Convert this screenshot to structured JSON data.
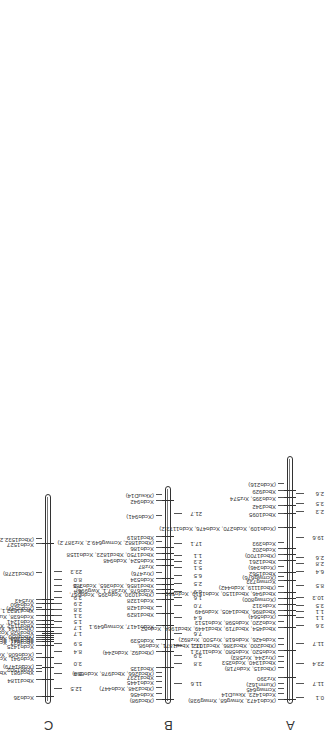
{
  "header": {
    "authors": "M.E. Sorrells, G. Pedak, S.J. Molnar, H.W. Rines, and R.L. Phillips"
  },
  "chromosomes": [
    {
      "id": "C",
      "label": "C",
      "bar": {
        "x": 40,
        "y": 48,
        "len": 210
      },
      "markers": [
        {
          "pos": 7,
          "text": "Xcdo36"
        },
        {
          "pos": 24,
          "text": "Xbcd1184"
        },
        {
          "pos": 32,
          "text": "Xbcd981, Xbcd1874"
        },
        {
          "pos": 35,
          "text": "Xcdo1502"
        },
        {
          "pos": 38,
          "text": "(Xcdo1479)"
        },
        {
          "pos": 46,
          "text": "Xcdo941, Xcdo1509, Xrz69"
        },
        {
          "pos": 50,
          "text": "(Xcdo608, Xcdo665, Xcdo1523, Xrz444)"
        },
        {
          "pos": 58,
          "text": "Xcdo1425"
        },
        {
          "pos": 62,
          "text": "Xbcd927, Xcdo54"
        },
        {
          "pos": 64,
          "text": "Xbcd941, Xcdo1174"
        },
        {
          "pos": 66,
          "text": "Xbcd263, Xcdo586, Xbcd721, Xbcd1194, Xbcd1495, Xcdo328, Xcdo585,"
        },
        {
          "pos": 68,
          "text": "(Xbcd850, Xbcd1688, Xcdo1160, Xcdo1253, Xrz244"
        },
        {
          "pos": 72,
          "text": "Xbcd828  Xcdo920, Xrz776)"
        },
        {
          "pos": 76,
          "text": "(Xbcd134, Xcdo1421, XNar)"
        },
        {
          "pos": 79,
          "text": "Xbcd1142, Xbcd1816, Xcdo353"
        },
        {
          "pos": 83,
          "text": "Xcdo1241"
        },
        {
          "pos": 88,
          "text": "Xcdo638, Xumn133"
        },
        {
          "pos": 94,
          "text": "Xbcd1532.1, Xcdo1435"
        },
        {
          "pos": 96,
          "text": "(Xcdo549)"
        },
        {
          "pos": 100,
          "text": "Xcdo460"
        },
        {
          "pos": 104,
          "text": "Xrz543"
        },
        {
          "pos": 131,
          "text": "(Xbcd1278)"
        },
        {
          "pos": 160,
          "text": "Xcdo1527"
        },
        {
          "pos": 165,
          "text": "(Xbcd1532.2)"
        }
      ],
      "distances": [
        "12.5",
        "5.4",
        "3.0",
        "8.4",
        "5.9",
        "1.7",
        "1.7",
        "1.5",
        "3.1",
        "3.8",
        "2.9",
        "3.9",
        "6.4",
        "7.3",
        "8.0",
        "23.3"
      ]
    },
    {
      "id": "B",
      "label": "B",
      "bar": {
        "x": 40,
        "y": 168,
        "len": 218
      },
      "markers": [
        {
          "pos": 4,
          "text": "(Xbcd98)"
        },
        {
          "pos": 10,
          "text": "Xcdo456"
        },
        {
          "pos": 16,
          "text": "(Xbcd348, Xcdo447)"
        },
        {
          "pos": 22,
          "text": "Xcdo1445"
        },
        {
          "pos": 27,
          "text": "Xbcd1237"
        },
        {
          "pos": 31,
          "text": "(Xbcd266, Xbcd978, Xcdo680)"
        },
        {
          "pos": 36,
          "text": "Xbcd135"
        },
        {
          "pos": 52,
          "text": "(Xbcd92, Xcdo244)"
        },
        {
          "pos": 64,
          "text": "Xcdo539"
        },
        {
          "pos": 78,
          "text": "Xcdo1417, Xcmwg649.1"
        },
        {
          "pos": 90,
          "text": "Xbcd1829"
        },
        {
          "pos": 97,
          "text": "Xbcd1428"
        },
        {
          "pos": 104,
          "text": "Xcdo1328"
        },
        {
          "pos": 110,
          "text": "(Xbcd1030, Xcdo395, Xcdo667,"
        },
        {
          "pos": 114,
          "text": "Xcdo678, Xrz387.1, Xwg996)"
        },
        {
          "pos": 119,
          "text": "Xbcd1856, Xcdo365, Xcdo385"
        },
        {
          "pos": 125,
          "text": "Xcdo534"
        },
        {
          "pos": 131,
          "text": "(Xrz476)"
        },
        {
          "pos": 138,
          "text": "Xrz87"
        },
        {
          "pos": 144,
          "text": "Xcdo524, Xcdo948"
        },
        {
          "pos": 150,
          "text": "Xbcd1750, Xbcd1823, Xcdo1158"
        },
        {
          "pos": 156,
          "text": "Xcdo186"
        },
        {
          "pos": 162,
          "text": "(Xbcd1882, Xcmwg649.2, Xrz387.2)"
        },
        {
          "pos": 167,
          "text": "Xbcd1819"
        },
        {
          "pos": 188,
          "text": "(Xcdo941)"
        },
        {
          "pos": 203,
          "text": "Xcdo942"
        },
        {
          "pos": 209,
          "text": "(XksuD14)"
        }
      ],
      "distances": [
        "11.6",
        "3.8",
        "3.9",
        "11.1",
        "7.6",
        "6.4",
        "7.0",
        "1.6",
        "6.9",
        "2.5",
        "6.5",
        "5.1",
        "2.3",
        "1.1",
        "17.1",
        "21.7"
      ]
    },
    {
      "id": "A",
      "label": "A",
      "bar": {
        "x": 40,
        "y": 290,
        "len": 248
      },
      "markers": [
        {
          "pos": 4,
          "text": "(Xcdo1473, Xmwg68, Xmwg938)"
        },
        {
          "pos": 10,
          "text": "Xcdo1423, XksuD14"
        },
        {
          "pos": 15,
          "text": "Xcmwg645"
        },
        {
          "pos": 20,
          "text": "(Xumn162)"
        },
        {
          "pos": 26,
          "text": "Xrz390"
        },
        {
          "pos": 36,
          "text": "(Xbcd15, Xcdo718)"
        },
        {
          "pos": 42,
          "text": "Xbcd1340, Xcdo353"
        },
        {
          "pos": 47,
          "text": "(Xrz244, Xrz583)"
        },
        {
          "pos": 53,
          "text": "Xcdo520, Xcdo580, Xcdo1173.1"
        },
        {
          "pos": 59,
          "text": "(Xbcd200, Xbcd386, Xbcd1072, Xbcd1871, Xcdo98,"
        },
        {
          "pos": 65,
          "text": "Xcdo426, Xcdo618, Xrz500, Xrz892)"
        },
        {
          "pos": 76,
          "text": "Xbcd454, Xbcd719, Xbcd1449, Xbcd1964, Xcdo82,"
        },
        {
          "pos": 82,
          "text": "Xcdo220, Xcdo598, Xcdo1513"
        },
        {
          "pos": 88,
          "text": "(Xcdo564)"
        },
        {
          "pos": 93,
          "text": "Xbcd896, Xbcd1405, Xcdo949"
        },
        {
          "pos": 99,
          "text": "Xcdo312"
        },
        {
          "pos": 105,
          "text": "(Xcmwg800)"
        },
        {
          "pos": 111,
          "text": "Xbcd946, Xbcd1150, Xcdo1519, Xcdo590"
        },
        {
          "pos": 117,
          "text": "(Xbcd1119, Xcdo442)"
        },
        {
          "pos": 123,
          "text": "Xcmwg733"
        },
        {
          "pos": 127,
          "text": "(Xcmwg676)"
        },
        {
          "pos": 131,
          "text": "Xbcd1562"
        },
        {
          "pos": 137,
          "text": "(Xcdo346)"
        },
        {
          "pos": 143,
          "text": "Xbcd1261"
        },
        {
          "pos": 149,
          "text": "(Xbcd1700)"
        },
        {
          "pos": 155,
          "text": "Xcdo202"
        },
        {
          "pos": 161,
          "text": "Xcdo393"
        },
        {
          "pos": 176,
          "text": "(Xcdo109, Xcdo270, Xcdo476, Xcdo1173.2)"
        },
        {
          "pos": 190,
          "text": "Xbcd1095"
        },
        {
          "pos": 198,
          "text": "Xbcd342"
        },
        {
          "pos": 206,
          "text": "Xcdo395, Xrz574"
        },
        {
          "pos": 213,
          "text": "Xbcd929"
        },
        {
          "pos": 220,
          "text": "(Xcdo216)"
        }
      ],
      "distances": [
        "0.1",
        "11.7",
        "23.4",
        "11.7",
        "3.6",
        "1.1",
        "1.1",
        "3.5",
        "10.3",
        "8.5",
        "6.4",
        "2.8",
        "2.6",
        "19.6",
        "2.3",
        "3.5",
        "2.6"
      ]
    }
  ],
  "layout_positions": {
    "C_ticks": [
      7,
      24,
      36,
      46,
      58,
      62,
      64,
      66,
      68,
      70,
      72,
      76,
      79,
      83,
      88,
      94,
      100,
      104,
      160
    ],
    "C_dist_x": [
      15,
      30,
      40,
      52,
      60,
      70,
      76,
      82,
      88,
      94,
      100,
      106,
      112,
      118,
      124,
      132
    ],
    "B_ticks": [
      4,
      36,
      52,
      64,
      78,
      90,
      104,
      110,
      114,
      119,
      125,
      138,
      144,
      150,
      156,
      167,
      203
    ],
    "B_dist_x": [
      20,
      40,
      48,
      58,
      70,
      86,
      98,
      106,
      112,
      120,
      128,
      136,
      142,
      148,
      160,
      190
    ],
    "A_ticks": [
      4,
      26,
      53,
      76,
      88,
      93,
      99,
      105,
      111,
      123,
      131,
      143,
      149,
      155,
      176,
      190,
      198,
      206,
      213
    ],
    "A_dist_x": [
      6,
      20,
      40,
      60,
      78,
      86,
      92,
      98,
      106,
      118,
      132,
      140,
      146,
      166,
      192,
      200,
      210
    ]
  }
}
